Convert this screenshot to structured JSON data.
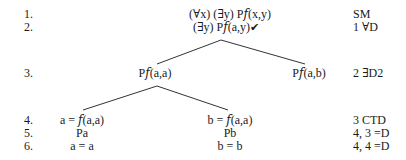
{
  "tree": {
    "rows": [
      {
        "num": "1.",
        "just": "SM"
      },
      {
        "num": "2.",
        "just": "1 ∀D"
      },
      {
        "num": "3.",
        "just": "2 ∃D2"
      },
      {
        "num": "4.",
        "just": "3 CTD"
      },
      {
        "num": "5.",
        "just": "4, 3 =D"
      },
      {
        "num": "6.",
        "just": "4, 4 =D"
      }
    ],
    "nodes": {
      "line1": "(∀x) (∃y) P𝑓(x,y)",
      "line2": "(∃y) P𝑓(a,y)",
      "line2_check": "✔",
      "line3_left": "P𝑓(a,a)",
      "line3_right": "P𝑓(a,b)",
      "line4_left": "a = 𝑓(a,a)",
      "line4_right": "b = 𝑓(a,a)",
      "line5_left": "Pa",
      "line5_right": "Pb",
      "line6_left": "a = a",
      "line6_right": "b = b"
    }
  }
}
